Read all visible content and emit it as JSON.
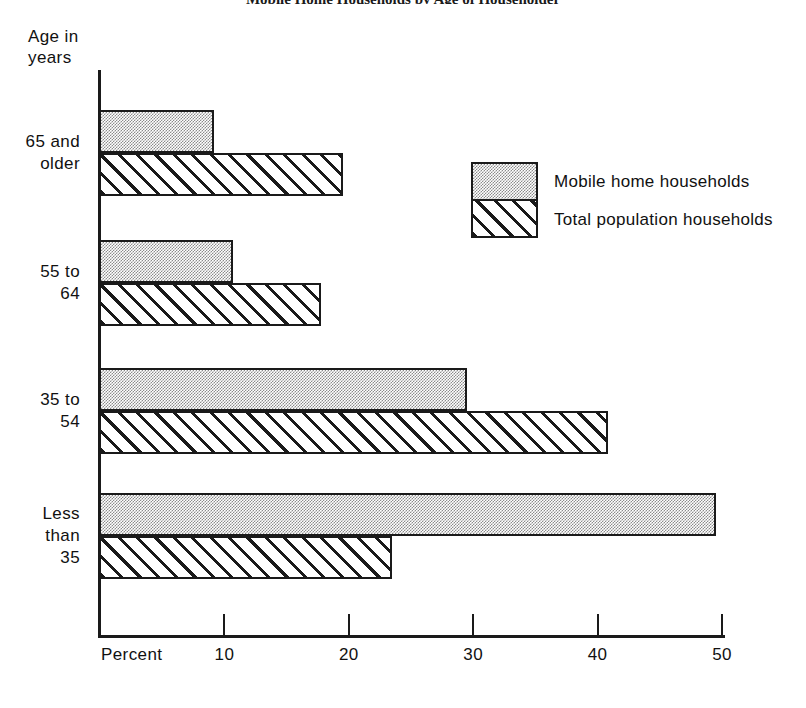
{
  "figure": {
    "cropped_header": "Mobile Home Households by Age of Householder",
    "y_axis_title": "Age in\nyears",
    "x_axis_title": "Percent"
  },
  "legend": {
    "position": "right-upper",
    "entries": [
      {
        "label": "Mobile home households",
        "pattern": "stipple"
      },
      {
        "label": "Total population households",
        "pattern": "hatch"
      }
    ]
  },
  "axis": {
    "x_ticks": [
      "10",
      "20",
      "30",
      "40",
      "50"
    ],
    "x_tick_values": [
      10,
      20,
      30,
      40,
      50
    ],
    "x_min": 0,
    "x_max": 50
  },
  "chart_data": {
    "type": "bar",
    "orientation": "horizontal",
    "title": "Mobile Home Households by Age of Householder",
    "xlabel": "Percent",
    "ylabel": "Age in years",
    "xlim": [
      0,
      50
    ],
    "grid": false,
    "legend_position": "right-upper",
    "categories": [
      "65 and\nolder",
      "55 to\n64",
      "35 to\n54",
      "Less\nthan\n35"
    ],
    "category_labels_plain": [
      "65 and older",
      "55 to 64",
      "35 to 54",
      "Less than 35"
    ],
    "series": [
      {
        "name": "Mobile home households",
        "pattern": "stipple",
        "values": [
          9.2,
          10.7,
          29.5,
          49.5
        ]
      },
      {
        "name": "Total population households",
        "pattern": "hatch",
        "values": [
          19.5,
          17.8,
          40.8,
          23.5
        ]
      }
    ]
  }
}
